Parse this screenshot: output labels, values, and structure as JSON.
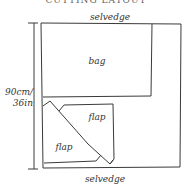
{
  "diagram": {
    "title_partial": "CUTTING LAYOUT",
    "labels": {
      "top_edge": "selvedge",
      "bottom_edge": "selvedge",
      "bag_piece": "bag",
      "flap_upper": "flap",
      "flap_lower": "flap",
      "width_line1": "90cm/",
      "width_line2": "36in"
    },
    "colors": {
      "line": "#3a3a3a",
      "text": "#333333",
      "background": "#ffffff"
    }
  }
}
